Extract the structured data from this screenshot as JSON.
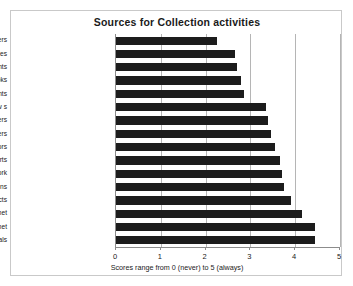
{
  "chart_data": {
    "type": "bar",
    "orientation": "horizontal",
    "title": "Sources for Collection activities",
    "xlabel": "Scores range from 0 (never) to 5 (always)",
    "ylabel": "",
    "xlim": [
      0,
      5
    ],
    "xticks": [
      "0",
      "1",
      "2",
      "3",
      "4",
      "5"
    ],
    "grid": true,
    "legend": false,
    "bar_color": "#1c1c1c",
    "categories": [
      "suppliers",
      "patent agencies",
      "governments",
      "books",
      "consultants",
      "tradeshow s",
      "new spapers",
      "customers",
      "competitors",
      "experts",
      "collection netw ork",
      "internal publications",
      "informal contacts",
      "on-line databased internet",
      "Internet",
      "trade journals"
    ],
    "values": [
      2.25,
      2.65,
      2.7,
      2.8,
      2.85,
      3.35,
      3.4,
      3.45,
      3.55,
      3.65,
      3.7,
      3.75,
      3.9,
      4.15,
      4.45,
      4.45
    ]
  }
}
